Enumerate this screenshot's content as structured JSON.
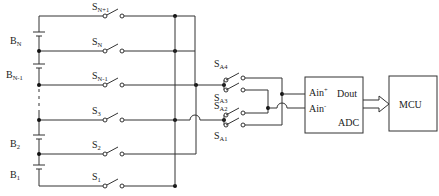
{
  "batteries": [
    {
      "label": "B",
      "sub": "N"
    },
    {
      "label": "B",
      "sub": "N-1"
    },
    {
      "label": "B",
      "sub": "2"
    },
    {
      "label": "B",
      "sub": "1"
    }
  ],
  "switches": [
    {
      "label": "S",
      "sub": "N+1"
    },
    {
      "label": "S",
      "sub": "N"
    },
    {
      "label": "S",
      "sub": "N-1"
    },
    {
      "label": "S",
      "sub": "3"
    },
    {
      "label": "S",
      "sub": "2"
    },
    {
      "label": "S",
      "sub": "1"
    }
  ],
  "selector_switches": [
    {
      "label": "S",
      "sub": "A4"
    },
    {
      "label": "S",
      "sub": "A3"
    },
    {
      "label": "S",
      "sub": "A2"
    },
    {
      "label": "S",
      "sub": "A1"
    }
  ],
  "adc": {
    "ain_plus": "Ain",
    "ain_plus_sup": "+",
    "ain_minus": "Ain",
    "ain_minus_sup": "-",
    "dout": "Dout",
    "name": "ADC"
  },
  "mcu": {
    "name": "MCU"
  }
}
